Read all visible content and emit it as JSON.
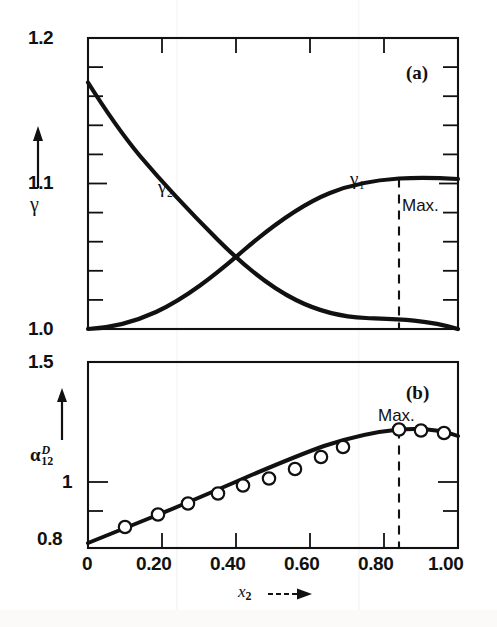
{
  "figure": {
    "background": "#ffffff",
    "ink": "#111111",
    "panels": [
      {
        "tag": "(a)",
        "ylabel": "γ",
        "y_ticks": [
          "1.2",
          "1.1",
          "1.0"
        ],
        "curve_labels": [
          "γ₂",
          "γ₁"
        ],
        "annotation": "Max."
      },
      {
        "tag": "(b)",
        "ylabel": "α",
        "ylabel_sup": "D",
        "ylabel_sub": "12",
        "y_ticks": [
          "1.5",
          "1",
          "0.8"
        ],
        "annotation": "Max."
      }
    ],
    "x_axis": {
      "label": "x",
      "label_sub": "2",
      "ticks": [
        "0",
        "0.20",
        "0.40",
        "0.60",
        "0.80",
        "1.00"
      ]
    }
  },
  "chart_data": [
    {
      "type": "line",
      "panel": "(a)",
      "title": "(a)",
      "xlabel": "x_2",
      "ylabel": "gamma",
      "xlim": [
        0,
        1
      ],
      "ylim": [
        1.0,
        1.2
      ],
      "yticks": [
        1.0,
        1.1,
        1.2
      ],
      "yticklabels": [
        "1.0",
        "1.1",
        "1.2"
      ],
      "minor_ytick_step": 0.02,
      "xticks": [
        0,
        0.2,
        0.4,
        0.6,
        0.8,
        1.0
      ],
      "grid": false,
      "legend": "inline-curve-labels",
      "annotations": [
        {
          "text": "Max.",
          "x": 0.84,
          "y": 1.087,
          "style": "dashed-vertical-line"
        }
      ],
      "series": [
        {
          "name": "γ₁",
          "label": "gamma_1",
          "x": [
            0.0,
            0.05,
            0.1,
            0.15,
            0.2,
            0.25,
            0.3,
            0.35,
            0.4,
            0.45,
            0.5,
            0.55,
            0.6,
            0.65,
            0.7,
            0.75,
            0.8,
            0.84,
            0.9,
            0.95,
            1.0
          ],
          "y": [
            1.0,
            1.0012,
            1.0035,
            1.0072,
            1.012,
            1.018,
            1.0248,
            1.032,
            1.0396,
            1.047,
            1.0545,
            1.0615,
            1.068,
            1.0735,
            1.0785,
            1.0825,
            1.086,
            1.0872,
            1.0875,
            1.0868,
            1.086
          ]
        },
        {
          "name": "γ₂",
          "label": "gamma_2",
          "x": [
            0.0,
            0.05,
            0.1,
            0.15,
            0.2,
            0.25,
            0.3,
            0.35,
            0.4,
            0.45,
            0.5,
            0.55,
            0.6,
            0.65,
            0.7,
            0.75,
            0.8,
            0.85,
            0.9,
            0.95,
            1.0
          ],
          "y": [
            1.17,
            1.1525,
            1.135,
            1.1175,
            1.1005,
            1.0845,
            1.069,
            1.0545,
            1.041,
            1.029,
            1.0185,
            1.0105,
            1.0045,
            1.001,
            0.9995,
            0.9992,
            0.9998,
            1.0002,
            1.0004,
            1.0003,
            1.0
          ]
        }
      ]
    },
    {
      "type": "scatter+line",
      "panel": "(b)",
      "title": "(b)",
      "xlabel": "x_2",
      "ylabel": "alpha_12^D",
      "xlim": [
        0,
        1
      ],
      "ylim": [
        0.8,
        1.5
      ],
      "yticks": [
        0.8,
        1.0,
        1.5
      ],
      "yticklabels": [
        "0.8",
        "1",
        "1.5"
      ],
      "xticks": [
        0,
        0.2,
        0.4,
        0.6,
        0.8,
        1.0
      ],
      "grid": false,
      "annotations": [
        {
          "text": "Max.",
          "x": 0.84,
          "y": 1.19,
          "style": "dashed-vertical-line"
        }
      ],
      "fit_curve": {
        "name": "smoothed fit",
        "x": [
          0.0,
          0.05,
          0.1,
          0.15,
          0.2,
          0.25,
          0.3,
          0.35,
          0.4,
          0.45,
          0.5,
          0.55,
          0.6,
          0.65,
          0.7,
          0.75,
          0.8,
          0.84,
          0.88,
          0.92,
          0.96,
          1.0
        ],
        "y": [
          0.82,
          0.845,
          0.87,
          0.895,
          0.92,
          0.943,
          0.965,
          0.987,
          1.007,
          1.027,
          1.047,
          1.066,
          1.086,
          1.107,
          1.128,
          1.15,
          1.172,
          1.186,
          1.189,
          1.186,
          1.18,
          1.172
        ]
      },
      "points": {
        "marker": "open-circle",
        "x": [
          0.1,
          0.19,
          0.27,
          0.35,
          0.42,
          0.49,
          0.56,
          0.63,
          0.69,
          0.84,
          0.9,
          0.96
        ],
        "y": [
          0.878,
          0.925,
          0.966,
          1.003,
          1.033,
          1.058,
          1.094,
          1.139,
          1.176,
          1.188,
          1.186,
          1.178
        ]
      }
    }
  ]
}
